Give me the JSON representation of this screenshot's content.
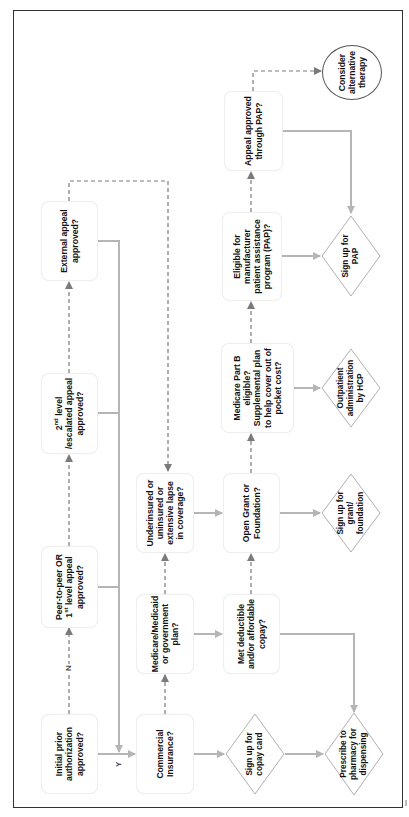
{
  "diagram": {
    "title": "",
    "orientation": "rotated-90-ccw",
    "colors": {
      "frame": "#333333",
      "solid_connector": "#b5b5b5",
      "dashed_connector": "#7a7a7a",
      "box_border": "#eeeeee",
      "diamond_border": "#b0b0b0",
      "circle_border": "#555555",
      "text": "#111111"
    },
    "nodes": {
      "initial_pa": {
        "shape": "rounded-box",
        "text": "Initial prior authorization approved?"
      },
      "peer_to_peer": {
        "shape": "rounded-box",
        "text_main": "Peer-to-peer OR 1",
        "text_sup": "st",
        "text_rest": " level appeal approved?"
      },
      "second_level": {
        "shape": "rounded-box",
        "text_main": "2",
        "text_sup": "nd",
        "text_rest": " level /escalated appeal approved?"
      },
      "external_appeal": {
        "shape": "rounded-box",
        "text": "External appeal approved?"
      },
      "commercial": {
        "shape": "rounded-box",
        "text": "Commercial Insurance?"
      },
      "medicare_medicaid": {
        "shape": "rounded-box",
        "text": "Medicare/Medicaid or government plan?"
      },
      "underinsured": {
        "shape": "rounded-box",
        "text": "Underinsured or uninsured or extensive lapse in coverage?"
      },
      "met_deductible": {
        "shape": "rounded-box",
        "text": "Met deductible and/or affordable copay?"
      },
      "open_grant": {
        "shape": "rounded-box",
        "text": "Open Grant or Foundation?"
      },
      "medicare_part_b": {
        "shape": "rounded-box",
        "text": "Medicare Part B eligible? Supplemental plan to help cover out of pocket cost?"
      },
      "eligible_pap": {
        "shape": "rounded-box",
        "text": "Eligible for manufacturer patient assistance program (PAP)?"
      },
      "appeal_pap": {
        "shape": "rounded-box",
        "text": "Appeal approved through PAP?"
      },
      "copay_card": {
        "shape": "diamond",
        "text": "Sign up for copay card"
      },
      "prescribe": {
        "shape": "diamond",
        "text": "Prescribe to pharmacy for dispensing"
      },
      "grant_foundation": {
        "shape": "diamond",
        "text": "Sign up for grant/ foundation"
      },
      "outpatient": {
        "shape": "diamond",
        "text": "Outpatient administration by HCP"
      },
      "sign_pap": {
        "shape": "diamond",
        "text": "Sign up for PAP"
      },
      "alternative": {
        "shape": "circle",
        "text": "Consider alternative therapy"
      }
    },
    "edge_labels": {
      "yes": "Y",
      "no": "N"
    },
    "edges": [
      {
        "from": "initial_pa",
        "to": "commercial",
        "style": "solid",
        "label": "Y"
      },
      {
        "from": "initial_pa",
        "to": "peer_to_peer",
        "style": "dashed",
        "label": "N"
      },
      {
        "from": "peer_to_peer",
        "to": "second_level",
        "style": "dashed"
      },
      {
        "from": "second_level",
        "to": "external_appeal",
        "style": "dashed"
      },
      {
        "from": "peer_to_peer",
        "to": "commercial",
        "style": "solid"
      },
      {
        "from": "second_level",
        "to": "commercial",
        "style": "solid"
      },
      {
        "from": "external_appeal",
        "to": "commercial",
        "style": "solid"
      },
      {
        "from": "external_appeal",
        "to": "underinsured",
        "style": "dashed"
      },
      {
        "from": "commercial",
        "to": "medicare_medicaid",
        "style": "dashed"
      },
      {
        "from": "medicare_medicaid",
        "to": "underinsured",
        "style": "dashed"
      },
      {
        "from": "commercial",
        "to": "copay_card",
        "style": "solid"
      },
      {
        "from": "copay_card",
        "to": "prescribe",
        "style": "solid"
      },
      {
        "from": "medicare_medicaid",
        "to": "met_deductible",
        "style": "solid"
      },
      {
        "from": "met_deductible",
        "to": "prescribe",
        "style": "solid"
      },
      {
        "from": "met_deductible",
        "to": "open_grant",
        "style": "dashed"
      },
      {
        "from": "underinsured",
        "to": "open_grant",
        "style": "solid"
      },
      {
        "from": "open_grant",
        "to": "grant_foundation",
        "style": "solid"
      },
      {
        "from": "open_grant",
        "to": "medicare_part_b",
        "style": "dashed"
      },
      {
        "from": "medicare_part_b",
        "to": "outpatient",
        "style": "solid"
      },
      {
        "from": "medicare_part_b",
        "to": "eligible_pap",
        "style": "dashed"
      },
      {
        "from": "eligible_pap",
        "to": "sign_pap",
        "style": "solid"
      },
      {
        "from": "eligible_pap",
        "to": "appeal_pap",
        "style": "dashed"
      },
      {
        "from": "appeal_pap",
        "to": "sign_pap",
        "style": "solid"
      },
      {
        "from": "appeal_pap",
        "to": "alternative",
        "style": "dashed"
      }
    ]
  }
}
